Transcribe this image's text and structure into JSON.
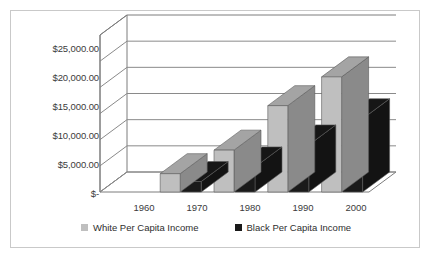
{
  "chart": {
    "frame_border_color": "#c9c9c9",
    "background": "#ffffff"
  },
  "legend": {
    "position": "bottom-center",
    "entries": [
      {
        "label": "White Per Capita Income",
        "color": "#bfbfbf",
        "swatch_name": "legend-swatch-white-per-capita"
      },
      {
        "label": "Black Per Capita Income",
        "color": "#1a1a1a",
        "swatch_name": "legend-swatch-black-per-capita"
      }
    ]
  },
  "axes": {
    "y_ticks": [
      "$25,000.00",
      "$20,000.00",
      "$15,000.00",
      "$10,000.00",
      "$5,000.00",
      "$-"
    ],
    "x_ticks": [
      "1960",
      "1970",
      "1980",
      "1990",
      "2000"
    ]
  },
  "chart_data": {
    "type": "bar",
    "title": "",
    "subtitle": "",
    "xlabel": "",
    "ylabel": "",
    "categories": [
      "1960",
      "1970",
      "1980",
      "1990",
      "2000"
    ],
    "series": [
      {
        "name": "White Per Capita Income",
        "color": "#bfbfbf",
        "values": [
          0,
          3500,
          8000,
          16500,
          22000
        ]
      },
      {
        "name": "Black Per Capita Income",
        "color": "#1a1a1a",
        "values": [
          0,
          2000,
          4800,
          9000,
          14000
        ]
      }
    ],
    "ylim": [
      0,
      30000
    ],
    "ytick_values": [
      0,
      5000,
      10000,
      15000,
      20000,
      25000
    ],
    "grid": true,
    "three_d": true,
    "legend_position": "bottom"
  }
}
